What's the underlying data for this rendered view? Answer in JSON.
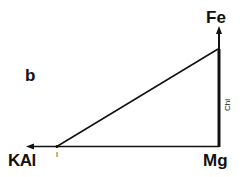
{
  "figure": {
    "panel_label": "b",
    "axes": {
      "vertical": {
        "label": "Fe",
        "arrow": "up"
      },
      "horizontal": {
        "label": "KAl",
        "arrow": "left"
      },
      "origin": {
        "label": "Mg"
      }
    },
    "annotations": {
      "vertical_edge": "Chl",
      "tick_mark": "I"
    },
    "colors": {
      "line": "#111111",
      "background": "#ffffff"
    }
  }
}
